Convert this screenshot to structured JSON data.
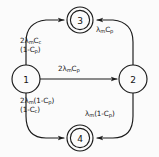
{
  "diagram": {
    "type": "state-transition-diagram",
    "title": "",
    "stroke_color": "#1a1a1a",
    "background_color": "#fbfbfb",
    "nodes": [
      {
        "id": "1",
        "label": "1",
        "shape": "circle",
        "double": false,
        "cx": 26,
        "cy": 79,
        "r": 14
      },
      {
        "id": "2",
        "label": "2",
        "shape": "circle",
        "double": false,
        "cx": 133,
        "cy": 79,
        "r": 14
      },
      {
        "id": "3",
        "label": "3",
        "shape": "double-circle",
        "double": true,
        "cx": 80,
        "cy": 20,
        "r": 13
      },
      {
        "id": "4",
        "label": "4",
        "shape": "double-circle",
        "double": true,
        "cx": 80,
        "cy": 138,
        "r": 13
      }
    ],
    "edges": [
      {
        "id": "e-1-3",
        "from": "1",
        "to": "3",
        "style": "curved",
        "label_lines": [
          "2λmCc",
          "(1-Cp)"
        ]
      },
      {
        "id": "e-2-3",
        "from": "2",
        "to": "3",
        "style": "curved",
        "label_lines": [
          "λmCp"
        ]
      },
      {
        "id": "e-1-2",
        "from": "1",
        "to": "2",
        "style": "straight",
        "label_lines": [
          "2λmCp"
        ]
      },
      {
        "id": "e-1-4",
        "from": "1",
        "to": "4",
        "style": "curved",
        "label_lines": [
          "2λm(1-Cp)",
          "(1-Cc)"
        ]
      },
      {
        "id": "e-2-4",
        "from": "2",
        "to": "4",
        "style": "curved",
        "label_lines": [
          "λm(1-Cp)"
        ]
      }
    ],
    "labels": {
      "edge_1_3_line1_pre": "2",
      "edge_1_3_line1_lam": "λ",
      "edge_1_3_line1_sub": "m",
      "edge_1_3_line1_c": "C",
      "edge_1_3_line1_csub": "c",
      "edge_1_3_line2_open": "(1-C",
      "edge_1_3_line2_sub": "p",
      "edge_1_3_line2_close": ")",
      "edge_2_3_lam": "λ",
      "edge_2_3_sub": "m",
      "edge_2_3_c": "C",
      "edge_2_3_csub": "p",
      "edge_1_2_pre": "2",
      "edge_1_2_lam": "λ",
      "edge_1_2_sub": "m",
      "edge_1_2_c": "C",
      "edge_1_2_csub": "p",
      "edge_1_4_line1_pre": "2",
      "edge_1_4_line1_lam": "λ",
      "edge_1_4_line1_sub": "m",
      "edge_1_4_line1_rest": "(1-C",
      "edge_1_4_line1_csub": "p",
      "edge_1_4_line1_close": ")",
      "edge_1_4_line2_open": "(1-C",
      "edge_1_4_line2_sub": "c",
      "edge_1_4_line2_close": ")",
      "edge_2_4_lam": "λ",
      "edge_2_4_sub": "m",
      "edge_2_4_rest": "(1-C",
      "edge_2_4_csub": "p",
      "edge_2_4_close": ")"
    }
  }
}
